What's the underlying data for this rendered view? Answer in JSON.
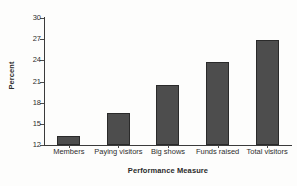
{
  "chart_data": {
    "type": "bar",
    "title": "",
    "subtitle": "",
    "categories": [
      "Members",
      "Paying visitors",
      "Big shows",
      "Funds raised",
      "Total visitors"
    ],
    "values": [
      13.3,
      16.5,
      20.5,
      23.7,
      26.9
    ],
    "xlabel": "Performance Measure",
    "ylabel": "Percent",
    "ylim": [
      12,
      30
    ],
    "yticks": [
      12,
      15,
      18,
      21,
      24,
      27,
      30
    ],
    "ytick_labels": [
      "12",
      "15",
      "18",
      "21",
      "24",
      "27",
      "30"
    ],
    "grid": false,
    "legend": false,
    "legend_position": "none",
    "annotations": [],
    "bar_color": "#4d4d4d",
    "bar_edge_color": "#2a2a2a",
    "axis_color": "#3b3b3b",
    "background_color": "#fdfdfc"
  }
}
